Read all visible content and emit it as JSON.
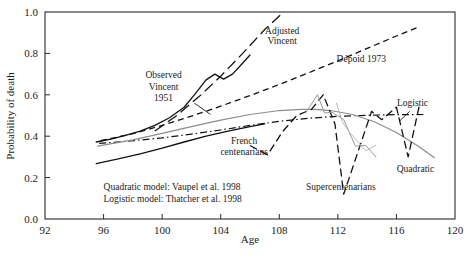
{
  "chart_data": {
    "type": "line",
    "title": "",
    "xlabel": "Age",
    "ylabel": "Probability of death",
    "xlim": [
      92,
      120
    ],
    "ylim": [
      0.0,
      1.0
    ],
    "xticks": [
      "92",
      "96",
      "100",
      "104",
      "108",
      "112",
      "116",
      "120"
    ],
    "yticks": [
      "0.0",
      "0.2",
      "0.4",
      "0.6",
      "0.8",
      "1.0"
    ],
    "grid": false,
    "legend_position": "inline-annotations",
    "annotations": [
      {
        "text": "Adjusted",
        "x": 108.2,
        "y": 0.895
      },
      {
        "text": "Vincent",
        "x": 108.2,
        "y": 0.845
      },
      {
        "text": "Observed",
        "x": 100.1,
        "y": 0.68
      },
      {
        "text": "Vincent",
        "x": 100.1,
        "y": 0.625
      },
      {
        "text": "1951",
        "x": 100.1,
        "y": 0.572
      },
      {
        "text": "Dépoid 1973",
        "x": 113.6,
        "y": 0.76
      },
      {
        "text": "Logistic",
        "x": 117.1,
        "y": 0.545
      },
      {
        "text": "French",
        "x": 105.6,
        "y": 0.362
      },
      {
        "text": "centenarians",
        "x": 105.6,
        "y": 0.31
      },
      {
        "text": "Supercentenarians",
        "x": 112.2,
        "y": 0.14
      },
      {
        "text": "Quadratic",
        "x": 117.3,
        "y": 0.225
      },
      {
        "text": "Quadratic model: Vaupel et al. 1998",
        "x": 96.0,
        "y": 0.142
      },
      {
        "text": "Logistic model: Thatcher et al. 1998",
        "x": 96.0,
        "y": 0.082
      }
    ],
    "series": [
      {
        "name": "Observed Vincent 1951",
        "style": "solid",
        "color": "#111111",
        "x": [
          95.5,
          96.5,
          97.5,
          98.5,
          99.5,
          100.5,
          101.5,
          102.2,
          103.0,
          103.6,
          104.2,
          104.8,
          105.4,
          106.0
        ],
        "y": [
          0.372,
          0.386,
          0.404,
          0.425,
          0.452,
          0.489,
          0.54,
          0.6,
          0.672,
          0.7,
          0.676,
          0.7,
          0.745,
          0.792
        ]
      },
      {
        "name": "Adjusted Vincent",
        "style": "long-dash",
        "color": "#111111",
        "x": [
          99.5,
          101.0,
          102.5,
          104.0,
          105.5,
          107.0,
          108.3
        ],
        "y": [
          0.425,
          0.5,
          0.59,
          0.69,
          0.8,
          0.915,
          1.0
        ]
      },
      {
        "name": "Dépoid 1973",
        "style": "dash",
        "color": "#111111",
        "x": [
          95.8,
          98.0,
          100.0,
          102.0,
          104.0,
          106.0,
          108.0,
          110.0,
          112.0,
          114.0,
          116.0,
          117.6
        ],
        "y": [
          0.378,
          0.412,
          0.452,
          0.497,
          0.545,
          0.596,
          0.65,
          0.706,
          0.764,
          0.824,
          0.884,
          0.93
        ]
      },
      {
        "name": "French centenarians",
        "style": "solid",
        "color": "#111111",
        "x": [
          95.5,
          97.0,
          98.5,
          100.0,
          101.5,
          103.0,
          104.5,
          106.0,
          107.0
        ],
        "y": [
          0.268,
          0.29,
          0.315,
          0.342,
          0.372,
          0.4,
          0.424,
          0.446,
          0.46
        ]
      },
      {
        "name": "Logistic",
        "style": "dash-dot",
        "color": "#111111",
        "x": [
          95.7,
          98.0,
          100.0,
          102.0,
          104.0,
          106.0,
          108.0,
          110.0,
          112.0,
          114.0,
          116.0,
          118.0
        ],
        "y": [
          0.365,
          0.378,
          0.392,
          0.41,
          0.43,
          0.452,
          0.472,
          0.487,
          0.496,
          0.501,
          0.504,
          0.505
        ]
      },
      {
        "name": "Quadratic",
        "style": "solid-gray",
        "color": "#8c8c8c",
        "x": [
          95.6,
          98.0,
          100.0,
          102.0,
          104.0,
          106.0,
          108.0,
          109.5,
          110.5,
          111.5,
          113.0,
          114.5,
          116.0,
          117.5,
          118.6
        ],
        "y": [
          0.352,
          0.382,
          0.414,
          0.446,
          0.478,
          0.505,
          0.524,
          0.53,
          0.53,
          0.524,
          0.505,
          0.47,
          0.418,
          0.352,
          0.296
        ]
      },
      {
        "name": "Supercentenarians",
        "style": "dash-long",
        "color": "#111111",
        "x": [
          106.0,
          107.2,
          108.2,
          109.2,
          110.2,
          111.0,
          111.8,
          112.4,
          113.4,
          114.3,
          115.0,
          116.0,
          116.8,
          117.6
        ],
        "y": [
          0.355,
          0.31,
          0.42,
          0.5,
          0.53,
          0.6,
          0.46,
          0.12,
          0.33,
          0.52,
          0.48,
          0.54,
          0.3,
          0.56
        ]
      },
      {
        "name": "Supercentenarians secondary",
        "style": "solid-gray-thin",
        "color": "#9a9a9a",
        "x": [
          109.8,
          110.6,
          111.1,
          111.6,
          112.4,
          113.2,
          113.9,
          114.6
        ],
        "y": [
          0.512,
          0.6,
          0.512,
          0.516,
          0.48,
          0.352,
          0.356,
          0.3
        ]
      },
      {
        "name": "Supercentenarians light",
        "style": "solid-gray-faint",
        "color": "#b3b3b3",
        "x": [
          111.9,
          112.3,
          112.8,
          113.3,
          113.9,
          114.6
        ],
        "y": [
          0.56,
          0.47,
          0.418,
          0.38,
          0.33,
          0.356
        ]
      }
    ],
    "leader_lines": [
      {
        "from": [
          102.2,
          0.56
        ],
        "to": [
          103.3,
          0.505
        ]
      },
      {
        "from": [
          116.9,
          0.52
        ],
        "to": [
          116.2,
          0.472
        ]
      }
    ]
  }
}
